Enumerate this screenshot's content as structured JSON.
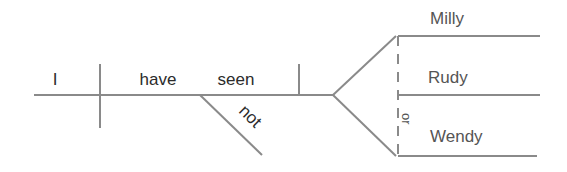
{
  "diagram": {
    "type": "sentence-diagram",
    "colors": {
      "line": "#8a8a8a",
      "text_dark": "#2b2b2b",
      "text_light": "#555555"
    },
    "subject": "I",
    "verb_words": [
      "have",
      "seen"
    ],
    "modifier": "not",
    "compound_objects": [
      "Milly",
      "Rudy",
      "Wendy"
    ],
    "conjunction": "or"
  }
}
